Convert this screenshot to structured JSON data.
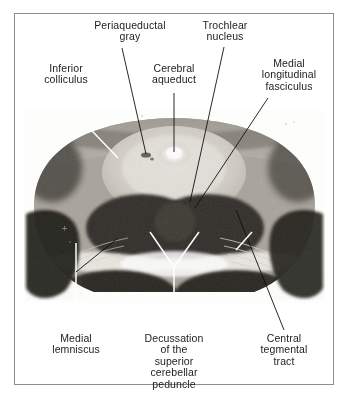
{
  "figure": {
    "type": "anatomical-cross-section",
    "modality": "stained histological section photograph",
    "frame_color": "#8d8d8d",
    "background_color": "#ffffff",
    "text_color": "#1c1c1c"
  },
  "labels": {
    "inferior_colliculus": "Inferior\ncolliculus",
    "periaqueductal_gray": "Periaqueductal\ngray",
    "cerebral_aqueduct": "Cerebral\naqueduct",
    "trochlear_nucleus": "Trochlear\nnucleus",
    "medial_longitudinal_fasciculus": "Medial\nlongitudinal\nfasciculus",
    "medial_lemniscus": "Medial\nlemniscus",
    "decussation_scp": "Decussation\nof the\nsuperior\ncerebellar\npeduncle",
    "central_tegmental_tract": "Central\ntegmental\ntract"
  },
  "leaders": {
    "inferior_colliculus_color": "#ffffff",
    "periaqueductal_gray_color": "#111111",
    "cerebral_aqueduct_color": "#111111",
    "trochlear_nucleus_color": "#111111",
    "medial_longitudinal_fasciculus_color": "#111111",
    "medial_lemniscus_color": "#ffffff",
    "decussation_scp_color": "#ffffff",
    "central_tegmental_tract_color": "#111111"
  }
}
